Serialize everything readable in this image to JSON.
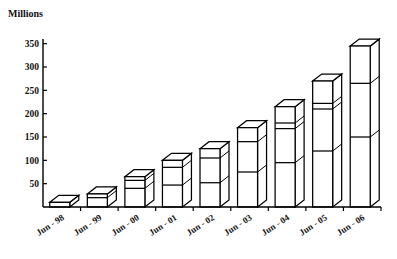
{
  "chart_data": {
    "type": "bar",
    "title": "",
    "ylabel": "Millions",
    "xlabel": "",
    "ylim": [
      0,
      360
    ],
    "yticks": [
      50,
      100,
      150,
      200,
      250,
      300,
      350
    ],
    "grid": false,
    "legend": "none",
    "style": "3d-isometric-stacked-bar",
    "categories": [
      "Jun - 98",
      "Jun - 99",
      "Jun - 00",
      "Jun - 01",
      "Jun - 02",
      "Jun - 03",
      "Jun - 04",
      "Jun - 05",
      "Jun - 06"
    ],
    "values": [
      10,
      28,
      65,
      100,
      125,
      170,
      215,
      270,
      345
    ],
    "segment_breaks": [
      [],
      [
        20
      ],
      [
        40,
        57
      ],
      [
        47,
        85
      ],
      [
        52,
        105
      ],
      [
        75,
        140
      ],
      [
        95,
        168,
        180
      ],
      [
        120,
        210,
        222
      ],
      [
        150,
        265
      ]
    ]
  },
  "axis": {
    "y_title": "Millions",
    "y_tick_labels": [
      "350",
      "300",
      "250",
      "200",
      "150",
      "100",
      "50"
    ],
    "x_tick_labels": [
      "Jun - 98",
      "Jun - 99",
      "Jun - 00",
      "Jun - 01",
      "Jun - 02",
      "Jun - 03",
      "Jun - 04",
      "Jun - 05",
      "Jun - 06"
    ]
  },
  "colors": {
    "axis": "#000000",
    "bar_fill": "#ffffff",
    "bar_stroke": "#000000",
    "text": "#111111",
    "background": "#ffffff"
  }
}
